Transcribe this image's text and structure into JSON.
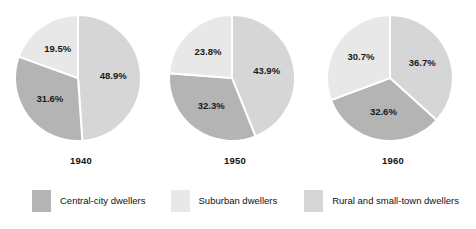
{
  "chart_data": {
    "type": "pie",
    "title": "",
    "subtitle": "",
    "xlabel": "",
    "ylabel": "",
    "grid": false,
    "legend_position": "bottom",
    "units": "percent",
    "categories": [
      "Central-city dwellers",
      "Suburban dwellers",
      "Rural and small-town dwellers"
    ],
    "colors": [
      "#b4b4b4",
      "#e8e8e8",
      "#d6d6d6"
    ],
    "panels": [
      {
        "label": "1940",
        "slices": [
          {
            "category": "Rural and small-town dwellers",
            "value": 48.9,
            "label": "48.9%",
            "color": "#d6d6d6"
          },
          {
            "category": "Central-city dwellers",
            "value": 31.6,
            "label": "31.6%",
            "color": "#b4b4b4"
          },
          {
            "category": "Suburban dwellers",
            "value": 19.5,
            "label": "19.5%",
            "color": "#e8e8e8"
          }
        ]
      },
      {
        "label": "1950",
        "slices": [
          {
            "category": "Rural and small-town dwellers",
            "value": 43.9,
            "label": "43.9%",
            "color": "#d6d6d6"
          },
          {
            "category": "Central-city dwellers",
            "value": 32.3,
            "label": "32.3%",
            "color": "#b4b4b4"
          },
          {
            "category": "Suburban dwellers",
            "value": 23.8,
            "label": "23.8%",
            "color": "#e8e8e8"
          }
        ]
      },
      {
        "label": "1960",
        "slices": [
          {
            "category": "Rural and small-town dwellers",
            "value": 36.7,
            "label": "36.7%",
            "color": "#d6d6d6"
          },
          {
            "category": "Central-city dwellers",
            "value": 32.6,
            "label": "32.6%",
            "color": "#b4b4b4"
          },
          {
            "category": "Suburban dwellers",
            "value": 30.7,
            "label": "30.7%",
            "color": "#e8e8e8"
          }
        ]
      }
    ],
    "series": [
      {
        "name": "Central-city dwellers",
        "values": [
          31.6,
          32.3,
          32.6
        ]
      },
      {
        "name": "Suburban dwellers",
        "values": [
          19.5,
          23.8,
          30.7
        ]
      },
      {
        "name": "Rural and small-town dwellers",
        "values": [
          48.9,
          43.9,
          36.7
        ]
      }
    ],
    "x": [
      "1940",
      "1950",
      "1960"
    ]
  },
  "legend": {
    "items": [
      {
        "label": "Central-city dwellers",
        "color": "#b4b4b4"
      },
      {
        "label": "Suburban dwellers",
        "color": "#e8e8e8"
      },
      {
        "label": "Rural and small-town dwellers",
        "color": "#d6d6d6"
      }
    ]
  }
}
